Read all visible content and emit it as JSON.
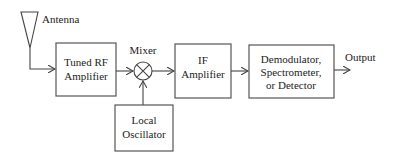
{
  "diagram": {
    "type": "block-diagram",
    "labels": {
      "antenna": "Antenna",
      "mixer": "Mixer",
      "output": "Output"
    },
    "blocks": [
      {
        "id": "tuned-rf-amplifier",
        "lines": [
          "Tuned RF",
          "Amplifier"
        ]
      },
      {
        "id": "local-oscillator",
        "lines": [
          "Local",
          "Oscillator"
        ]
      },
      {
        "id": "if-amplifier",
        "lines": [
          "IF",
          "Amplifier"
        ]
      },
      {
        "id": "demodulator",
        "lines": [
          "Demodulator,",
          "Spectrometer,",
          "or Detector"
        ]
      }
    ],
    "connections": [
      [
        "antenna",
        "tuned-rf-amplifier"
      ],
      [
        "tuned-rf-amplifier",
        "mixer"
      ],
      [
        "local-oscillator",
        "mixer"
      ],
      [
        "mixer",
        "if-amplifier"
      ],
      [
        "if-amplifier",
        "demodulator"
      ],
      [
        "demodulator",
        "output"
      ]
    ],
    "colors": {
      "stroke": "#555555",
      "text": "#222222",
      "background": "#ffffff"
    }
  }
}
